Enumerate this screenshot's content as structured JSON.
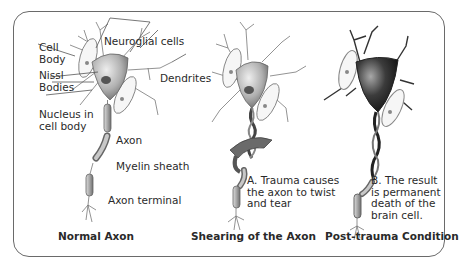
{
  "diagram": {
    "panels": [
      {
        "caption": "Normal Axon",
        "labels": {
          "neuroglial": "Neuroglial cells",
          "cell_body": "Cell\nBody",
          "nissl": "Nissl\nBodies",
          "dendrites": "Dendrites",
          "nucleus": "Nucleus in\ncell body",
          "axon": "Axon",
          "myelin": "Myelin sheath",
          "terminal": "Axon terminal"
        }
      },
      {
        "caption": "Shearing of the Axon",
        "annotation": "A. Trauma causes\nthe axon to twist\nand tear"
      },
      {
        "caption": "Post-trauma Condition",
        "annotation": "B. The result\nis permanent\ndeath of the\nbrain cell."
      }
    ],
    "colors": {
      "border": "#6a6a6a",
      "text": "#2a2a2a",
      "cell_normal": "#b8b8b8",
      "cell_dead": "#2e2e2e"
    }
  }
}
